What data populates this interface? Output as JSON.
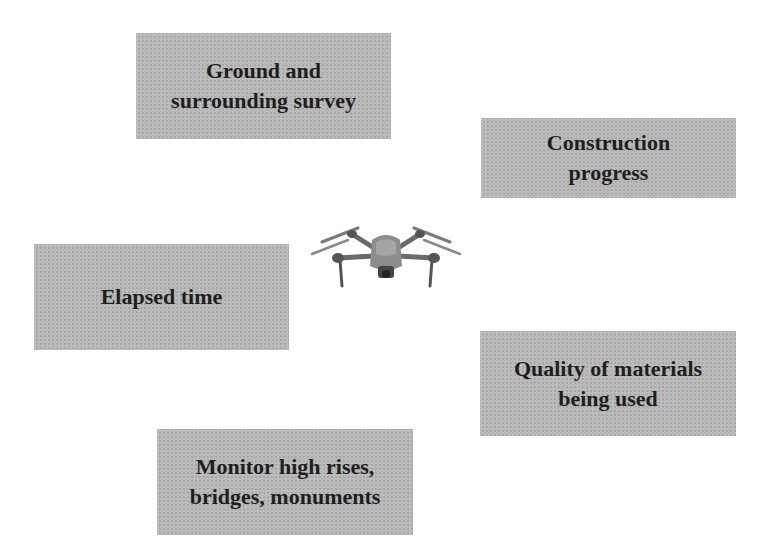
{
  "diagram": {
    "center": {
      "icon": "drone-icon"
    },
    "boxes": [
      {
        "id": "ground",
        "label": "Ground and\nsurrounding survey"
      },
      {
        "id": "construction",
        "label": "Construction\nprogress"
      },
      {
        "id": "elapsed",
        "label": "Elapsed time"
      },
      {
        "id": "quality",
        "label": "Quality of materials\nbeing used"
      },
      {
        "id": "monitor",
        "label": "Monitor high rises,\nbridges, monuments"
      }
    ],
    "colors": {
      "box_fill": "#b9b9b9",
      "text": "#1e1e1e",
      "background": "#ffffff"
    }
  }
}
